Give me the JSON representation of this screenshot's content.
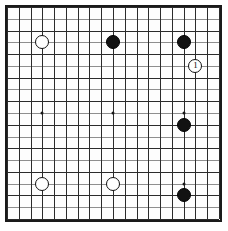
{
  "figure": {
    "board_size": 19,
    "caption": ""
  },
  "colors": {
    "black_stone": "#121212",
    "white_stone": "#ffffff",
    "stone_outline": "#111111",
    "grid_line": "#2b2b2b",
    "grid_line_faint": "#8e8e8e",
    "border": "#1a1a1a",
    "background": "#ffffff"
  },
  "geometry": {
    "origin_x": 7,
    "origin_y": 7,
    "step": 11.78,
    "lines": 19,
    "faint_rows": [
      1,
      3,
      5,
      7,
      9,
      11,
      13,
      15,
      17
    ],
    "star_points": [
      {
        "col": 3,
        "row": 3
      },
      {
        "col": 9,
        "row": 3
      },
      {
        "col": 15,
        "row": 3
      },
      {
        "col": 3,
        "row": 9
      },
      {
        "col": 9,
        "row": 9
      },
      {
        "col": 15,
        "row": 9
      },
      {
        "col": 3,
        "row": 15
      },
      {
        "col": 9,
        "row": 15
      },
      {
        "col": 15,
        "row": 15
      }
    ]
  },
  "stones": [
    {
      "id": "w-d16",
      "color": "white",
      "col": 3,
      "row": 3,
      "label": ""
    },
    {
      "id": "b-k16",
      "color": "black",
      "col": 9,
      "row": 3,
      "label": ""
    },
    {
      "id": "b-q16",
      "color": "black",
      "col": 15,
      "row": 3,
      "label": ""
    },
    {
      "id": "w-move-1",
      "color": "white",
      "col": 16,
      "row": 5,
      "label": "1"
    },
    {
      "id": "b-q10",
      "color": "black",
      "col": 15,
      "row": 10,
      "label": ""
    },
    {
      "id": "w-d4",
      "color": "white",
      "col": 3,
      "row": 15,
      "label": ""
    },
    {
      "id": "w-k4",
      "color": "white",
      "col": 9,
      "row": 15,
      "label": ""
    },
    {
      "id": "b-q3",
      "color": "black",
      "col": 15,
      "row": 16,
      "label": ""
    }
  ]
}
